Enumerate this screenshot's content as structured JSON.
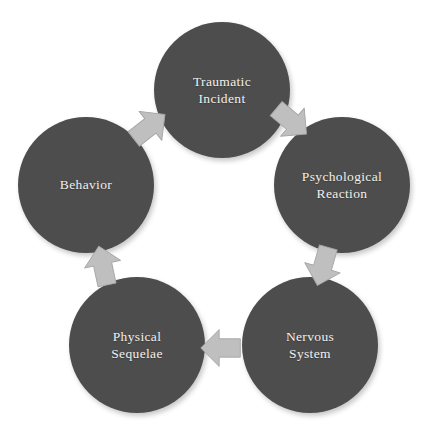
{
  "diagram": {
    "type": "cycle",
    "direction": "clockwise",
    "background_color": "#ffffff",
    "node_color": "#4d4d4d",
    "node_text_color": "#f2f0ec",
    "arrow_color": "#bfbfbf",
    "arrow_outline_color": "#a6a6a6",
    "nodes": [
      {
        "id": "traumatic-incident",
        "label": "Traumatic\nIncident",
        "position": "top"
      },
      {
        "id": "psychological-reaction",
        "label": "Psychological\nReaction",
        "position": "right"
      },
      {
        "id": "nervous-system",
        "label": "Nervous\nSystem",
        "position": "bottom-right"
      },
      {
        "id": "physical-sequelae",
        "label": "Physical\nSequelae",
        "position": "bottom-left"
      },
      {
        "id": "behavior",
        "label": "Behavior",
        "position": "left"
      }
    ],
    "arrows": [
      {
        "id": "arrow-traumatic-to-psychological",
        "from": "traumatic-incident",
        "to": "psychological-reaction",
        "direction": "down-right",
        "rotation_deg": 130
      },
      {
        "id": "arrow-psychological-to-nervous",
        "from": "psychological-reaction",
        "to": "nervous-system",
        "direction": "down-left",
        "rotation_deg": 196
      },
      {
        "id": "arrow-nervous-to-physical",
        "from": "nervous-system",
        "to": "physical-sequelae",
        "direction": "left",
        "rotation_deg": 270
      },
      {
        "id": "arrow-physical-to-behavior",
        "from": "physical-sequelae",
        "to": "behavior",
        "direction": "up-right",
        "rotation_deg": 348
      },
      {
        "id": "arrow-behavior-to-traumatic",
        "from": "behavior",
        "to": "traumatic-incident",
        "direction": "up-right",
        "rotation_deg": 52
      }
    ]
  }
}
